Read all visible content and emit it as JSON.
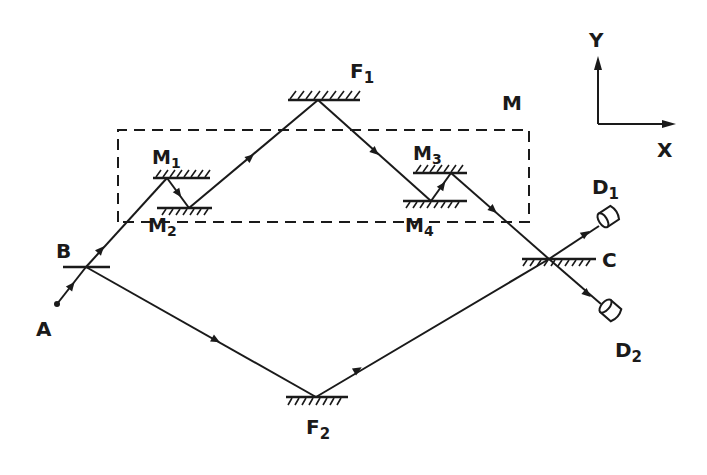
{
  "diagram": {
    "type": "optical-interferometer-beam-path",
    "colors": {
      "ink": "#1a1a1a",
      "background": "#ffffff"
    },
    "labels": {
      "source": "A",
      "splitter": "B",
      "mirror_f1": "F",
      "mirror_f1_sub": "1",
      "mirror_f2": "F",
      "mirror_f2_sub": "2",
      "module": "M",
      "m1": "M",
      "m1_sub": "1",
      "m2": "M",
      "m2_sub": "2",
      "m3": "M",
      "m3_sub": "3",
      "m4": "M",
      "m4_sub": "4",
      "combiner": "C",
      "detector1": "D",
      "detector1_sub": "1",
      "detector2": "D",
      "detector2_sub": "2",
      "axis_x": "X",
      "axis_y": "Y"
    },
    "nodes": [
      {
        "id": "A",
        "role": "source-point"
      },
      {
        "id": "B",
        "role": "beam-splitter"
      },
      {
        "id": "M1",
        "role": "mirror"
      },
      {
        "id": "M2",
        "role": "mirror"
      },
      {
        "id": "F1",
        "role": "fixed-mirror"
      },
      {
        "id": "M3",
        "role": "mirror"
      },
      {
        "id": "M4",
        "role": "mirror"
      },
      {
        "id": "C",
        "role": "beam-combiner"
      },
      {
        "id": "F2",
        "role": "fixed-mirror"
      },
      {
        "id": "D1",
        "role": "detector"
      },
      {
        "id": "D2",
        "role": "detector"
      }
    ],
    "paths": [
      [
        "A",
        "B",
        "M1",
        "M2",
        "F1",
        "M4",
        "M3",
        "C",
        "D2"
      ],
      [
        "A",
        "B",
        "F2",
        "C",
        "D1"
      ]
    ],
    "group": {
      "id": "M",
      "members": [
        "M1",
        "M2",
        "M3",
        "M4"
      ],
      "style": "dashed-rectangle"
    }
  }
}
